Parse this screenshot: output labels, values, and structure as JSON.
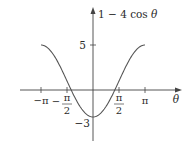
{
  "chart_data": {
    "type": "line",
    "title": "",
    "function": "1 - 4 cos θ",
    "xlabel": "θ",
    "ylabel": "1 − 4 cos θ",
    "xlim": [
      -3.14159,
      3.14159
    ],
    "ylim": [
      -3,
      5
    ],
    "grid": false,
    "legend": null,
    "x_ticks": [
      {
        "value": -3.14159,
        "label": "−π"
      },
      {
        "value": -1.5708,
        "label_num": "π",
        "label_den": "2",
        "sign": "−"
      },
      {
        "value": 1.5708,
        "label_num": "π",
        "label_den": "2",
        "sign": ""
      },
      {
        "value": 3.14159,
        "label": "π"
      }
    ],
    "y_ticks": [
      {
        "value": 5,
        "label": "5"
      },
      {
        "value": -3,
        "label": "−3"
      }
    ],
    "series": [
      {
        "name": "1 − 4 cos θ",
        "x": [
          -3.1416,
          -2.618,
          -2.0944,
          -1.5708,
          -1.0472,
          -0.5236,
          0,
          0.5236,
          1.0472,
          1.5708,
          2.0944,
          2.618,
          3.1416
        ],
        "values": [
          5,
          4.46,
          3,
          1,
          -1,
          -2.46,
          -3,
          -2.46,
          -1,
          1,
          3,
          4.46,
          5
        ],
        "color": "#555555"
      }
    ]
  },
  "labels": {
    "y_axis_label_prefix": "1 − 4 cos ",
    "y_axis_label_var": "θ",
    "x_axis_label": "θ",
    "tick_neg_pi": "−π",
    "tick_pi": "π",
    "tick_half_num": "π",
    "tick_half_den": "2",
    "tick_neg_sign": "−",
    "tick_y5": "5",
    "tick_yneg3": "−3"
  }
}
